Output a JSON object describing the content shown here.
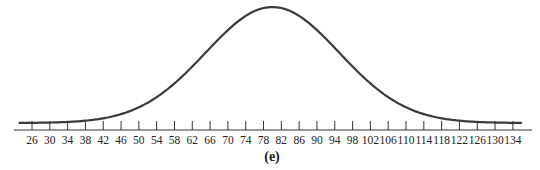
{
  "chart_data": {
    "type": "line",
    "title": "",
    "caption": "(e)",
    "xlabel": "",
    "ylabel": "",
    "x_ticks": [
      26,
      30,
      34,
      38,
      42,
      46,
      50,
      54,
      58,
      62,
      66,
      70,
      74,
      78,
      82,
      86,
      90,
      94,
      98,
      102,
      106,
      110,
      114,
      118,
      122,
      126,
      130,
      134
    ],
    "xlim": [
      24,
      138
    ],
    "grid": false,
    "legend": null,
    "series": [
      {
        "name": "distribution",
        "mean": 80,
        "sd": 15,
        "x": [
          24,
          30,
          34,
          38,
          42,
          46,
          50,
          54,
          58,
          62,
          66,
          70,
          74,
          78,
          80,
          82,
          86,
          90,
          94,
          98,
          102,
          106,
          110,
          114,
          118,
          122,
          126,
          130,
          136
        ],
        "y": [
          0.0,
          0.01,
          0.01,
          0.02,
          0.04,
          0.08,
          0.14,
          0.22,
          0.34,
          0.49,
          0.65,
          0.8,
          0.92,
          0.99,
          1.0,
          0.99,
          0.92,
          0.8,
          0.65,
          0.49,
          0.34,
          0.22,
          0.14,
          0.08,
          0.04,
          0.02,
          0.01,
          0.01,
          0.0
        ]
      }
    ]
  },
  "colors": {
    "curve": "#3a3a3a",
    "axis": "#333333"
  }
}
